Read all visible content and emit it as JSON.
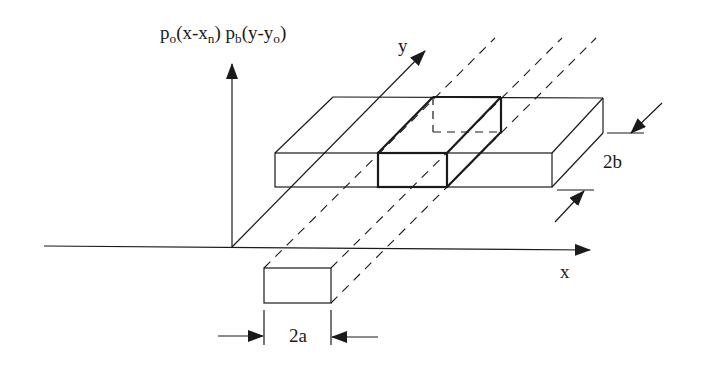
{
  "diagram": {
    "title_expression": {
      "p1": "p",
      "p1_sub": "o",
      "p1_arg": "(x-x",
      "p1_arg_sub": "n",
      "p1_close": ")",
      "p2": " p",
      "p2_sub": "b",
      "p2_arg": "(y-y",
      "p2_arg_sub": "o",
      "p2_close": ")"
    },
    "axes": {
      "x_label": "x",
      "y_label": "y"
    },
    "dimensions": {
      "width_label": "2a",
      "depth_label": "2b"
    },
    "colors": {
      "stroke": "#1a1a1a",
      "background": "#ffffff"
    }
  }
}
